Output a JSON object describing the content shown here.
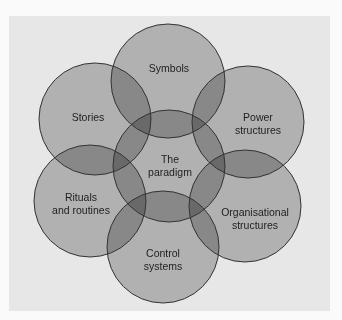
{
  "diagram": {
    "colors": {
      "page_background": "#fafafa",
      "panel_background": "#e7e7e7",
      "circle_fill": "#c4c4c4",
      "circle_stroke": "#333333",
      "text": "#1e1e1e"
    },
    "circles": [
      {
        "id": "symbols",
        "label_lines": [
          "Symbols"
        ],
        "cx": 168,
        "cy": 81,
        "r": 57,
        "label_x": 169,
        "label_y": [
          72
        ]
      },
      {
        "id": "stories",
        "label_lines": [
          "Stories"
        ],
        "cx": 95,
        "cy": 119,
        "r": 56,
        "label_x": 88,
        "label_y": [
          121
        ]
      },
      {
        "id": "power-structures",
        "label_lines": [
          "Power",
          "structures"
        ],
        "cx": 248,
        "cy": 122,
        "r": 56,
        "label_x": 258,
        "label_y": [
          121,
          134
        ]
      },
      {
        "id": "paradigm",
        "label_lines": [
          "The",
          "paradigm"
        ],
        "cx": 169,
        "cy": 166,
        "r": 56,
        "label_x": 170,
        "label_y": [
          163,
          176
        ]
      },
      {
        "id": "rituals-and-routines",
        "label_lines": [
          "Rituals",
          "and routines"
        ],
        "cx": 90,
        "cy": 201,
        "r": 56,
        "label_x": 81,
        "label_y": [
          201,
          214
        ]
      },
      {
        "id": "organisational-structures",
        "label_lines": [
          "Organisational",
          "structures"
        ],
        "cx": 245,
        "cy": 206,
        "r": 56,
        "label_x": 255,
        "label_y": [
          216,
          229
        ]
      },
      {
        "id": "control-systems",
        "label_lines": [
          "Control",
          "systems"
        ],
        "cx": 163,
        "cy": 247,
        "r": 56,
        "label_x": 163,
        "label_y": [
          257,
          270
        ]
      }
    ],
    "labels": {
      "symbols": "Symbols",
      "stories": "Stories",
      "power_line1": "Power",
      "power_line2": "structures",
      "paradigm_line1": "The",
      "paradigm_line2": "paradigm",
      "rituals_line1": "Rituals",
      "rituals_line2": "and routines",
      "org_line1": "Organisational",
      "org_line2": "structures",
      "control_line1": "Control",
      "control_line2": "systems"
    }
  }
}
